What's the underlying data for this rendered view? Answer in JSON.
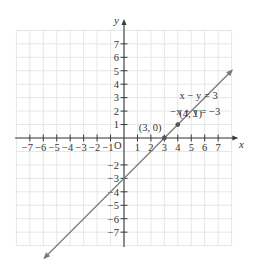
{
  "axes": {
    "x_label": "x",
    "y_label": "y",
    "origin_label": "O",
    "x_ticks": [
      -7,
      -6,
      -5,
      -4,
      -3,
      -2,
      -1,
      1,
      2,
      3,
      4,
      5,
      6,
      7
    ],
    "y_ticks": [
      -7,
      -6,
      -5,
      -4,
      -3,
      -2,
      1,
      2,
      3,
      4,
      5,
      6,
      7
    ],
    "x_range": [
      -8,
      8
    ],
    "y_range": [
      -8,
      8
    ]
  },
  "equations": {
    "eq1": "x − y = 3",
    "eq2": "−x + y = −3"
  },
  "points": [
    {
      "label": "(3, 0)",
      "x": 3,
      "y": 0
    },
    {
      "label": "(4, 1)",
      "x": 4,
      "y": 1
    }
  ],
  "line": {
    "color": "#7a7a7a",
    "slope": 1,
    "intercept": -3,
    "start": [
      -5.9,
      -8.9
    ],
    "end": [
      8.0,
      5.0
    ]
  },
  "colors": {
    "grid": "#e6e6e6",
    "axis": "#3a3a3a",
    "line": "#7a7a7a",
    "point": "#555555"
  },
  "chart_data": {
    "type": "line",
    "title": "",
    "xlabel": "x",
    "ylabel": "y",
    "xlim": [
      -8,
      8
    ],
    "ylim": [
      -8,
      8
    ],
    "grid": true,
    "series": [
      {
        "name": "x − y = 3 / −x + y = −3",
        "equation": "y = x − 3",
        "x": [
          -5.9,
          8.0
        ],
        "y": [
          -8.9,
          5.0
        ],
        "arrows": "both"
      }
    ],
    "annotations": [
      {
        "text": "x − y = 3",
        "x": 5.1,
        "y": 3.3
      },
      {
        "text": "−x + y = −3",
        "x": 5.1,
        "y": 2.0
      },
      {
        "text": "(3, 0)",
        "x": 2.2,
        "y": 0.6,
        "marker": [
          3,
          0
        ]
      },
      {
        "text": "(4, 1)",
        "x": 4.9,
        "y": 0.6,
        "marker": [
          4,
          1
        ]
      }
    ],
    "x_ticks": [
      -7,
      -6,
      -5,
      -4,
      -3,
      -2,
      -1,
      1,
      2,
      3,
      4,
      5,
      6,
      7
    ],
    "y_ticks": [
      -7,
      -6,
      -5,
      -4,
      -3,
      -2,
      1,
      2,
      3,
      4,
      5,
      6,
      7
    ]
  }
}
